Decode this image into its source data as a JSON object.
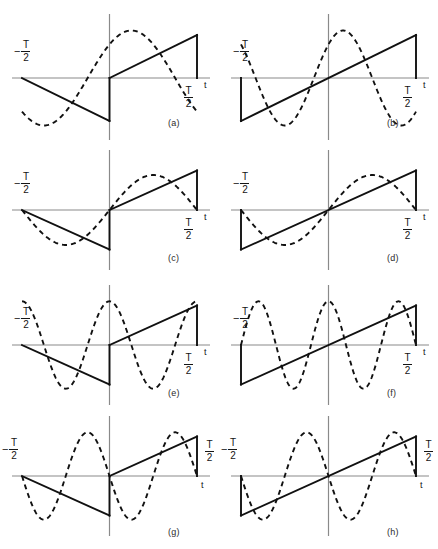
{
  "figure": {
    "title": "",
    "background": "#ffffff",
    "solid_color": "#111111",
    "dashed_color": "#111111",
    "axis_color": "#8a8a8a",
    "columns": 2,
    "rows": 4,
    "panel_width": 219,
    "panel_height": 137,
    "axis_labels": {
      "left_minus": "−",
      "numerator": "T",
      "denominator": "2",
      "time_axis": "t"
    }
  },
  "chart_data": {
    "type": "line",
    "title": "",
    "xlabel": "t",
    "ylabel": "",
    "xlim": [
      -0.5,
      0.5
    ],
    "ylim": [
      -1.15,
      1.15
    ],
    "grid": false,
    "legend": null,
    "shared": {
      "x_ticks": [
        -0.5,
        0,
        0.5
      ],
      "x_tick_labels": [
        "-T/2",
        "0",
        "T/2"
      ],
      "period_T": 1,
      "solid_style": "solid",
      "dashed_style": "dashed",
      "dash_pattern": "5,4"
    },
    "panels": [
      {
        "id": "a",
        "letter": "(a)",
        "solid": {
          "name": "sawtooth-half-shift",
          "type": "sawtooth",
          "description": "descending ramp on [-T/2,0) from 0 to -1, jump to 0, ascending ramp on [0,T/2) from 0 to +1, vertical drop at T/2",
          "segments": [
            {
              "points": [
                [
                  -0.5,
                  0.0
                ],
                [
                  0.0,
                  -0.86
                ]
              ]
            },
            {
              "points": [
                [
                  0.0,
                  -0.86
                ],
                [
                  0.0,
                  0.0
                ]
              ]
            },
            {
              "points": [
                [
                  0.0,
                  0.0
                ],
                [
                  0.5,
                  0.86
                ]
              ]
            },
            {
              "points": [
                [
                  0.5,
                  0.86
                ],
                [
                  0.5,
                  0.0
                ]
              ]
            }
          ]
        },
        "dashed": {
          "name": "harmonic-1-cosine-like",
          "type": "sinusoid",
          "harmonic": 1,
          "amplitude": 0.95,
          "phase_deg": 45,
          "expression": "A*sin(2*pi*t/T + 45deg)"
        },
        "labels": {
          "left": "-T/2",
          "right": "T/2",
          "axis": "t"
        }
      },
      {
        "id": "b",
        "letter": "(b)",
        "solid": {
          "name": "sawtooth-full-ramp",
          "type": "sawtooth",
          "description": "ramp from -1 at -T/2 rising linearly to +1 at T/2, vertical risers at both ends",
          "segments": [
            {
              "points": [
                [
                  -0.5,
                  0.0
                ],
                [
                  -0.5,
                  -0.86
                ]
              ]
            },
            {
              "points": [
                [
                  -0.5,
                  -0.86
                ],
                [
                  0.5,
                  0.86
                ]
              ]
            },
            {
              "points": [
                [
                  0.5,
                  0.86
                ],
                [
                  0.5,
                  0.0
                ]
              ]
            }
          ]
        },
        "dashed": {
          "name": "harmonic-1-shifted",
          "type": "sinusoid",
          "harmonic": 1.5,
          "amplitude": 0.95,
          "phase_deg": 45,
          "expression": "A*sin(3*pi*t/T + 45deg)"
        },
        "labels": {
          "left": "-T/2",
          "right": "T/2",
          "axis": "t"
        }
      },
      {
        "id": "c",
        "letter": "(c)",
        "solid": {
          "name": "sawtooth-half-shift",
          "type": "sawtooth",
          "description": "descending ramp on [-T/2,0) from 0 to -1, jump to 0, ascending ramp on [0,T/2) from 0 to +1, vertical drop at T/2",
          "segments": [
            {
              "points": [
                [
                  -0.5,
                  0.0
                ],
                [
                  0.0,
                  -0.86
                ]
              ]
            },
            {
              "points": [
                [
                  0.0,
                  -0.86
                ],
                [
                  0.0,
                  0.0
                ]
              ]
            },
            {
              "points": [
                [
                  0.0,
                  0.0
                ],
                [
                  0.5,
                  0.86
                ]
              ]
            },
            {
              "points": [
                [
                  0.5,
                  0.86
                ],
                [
                  0.5,
                  0.0
                ]
              ]
            }
          ]
        },
        "dashed": {
          "name": "harmonic-1-sine",
          "type": "sinusoid",
          "harmonic": 1,
          "amplitude": 0.76,
          "phase_deg": 0,
          "expression": "A*sin(2*pi*t/T)"
        },
        "labels": {
          "left": "-T/2",
          "right": "T/2",
          "axis": "t"
        }
      },
      {
        "id": "d",
        "letter": "(d)",
        "solid": {
          "name": "sawtooth-full-ramp",
          "type": "sawtooth",
          "description": "ramp from -1 at -T/2 rising linearly to +1 at T/2, vertical risers at both ends",
          "segments": [
            {
              "points": [
                [
                  -0.5,
                  0.0
                ],
                [
                  -0.5,
                  -0.86
                ]
              ]
            },
            {
              "points": [
                [
                  -0.5,
                  -0.86
                ],
                [
                  0.5,
                  0.86
                ]
              ]
            },
            {
              "points": [
                [
                  0.5,
                  0.86
                ],
                [
                  0.5,
                  0.0
                ]
              ]
            }
          ]
        },
        "dashed": {
          "name": "harmonic-1-sine",
          "type": "sinusoid",
          "harmonic": 1,
          "amplitude": 0.76,
          "phase_deg": 0,
          "expression": "A*sin(2*pi*t/T)"
        },
        "labels": {
          "left": "-T/2",
          "right": "T/2",
          "axis": "t"
        }
      },
      {
        "id": "e",
        "letter": "(e)",
        "solid": {
          "name": "sawtooth-half-shift",
          "type": "sawtooth",
          "description": "descending ramp on [-T/2,0) from 0 to -1, jump to 0, ascending ramp on [0,T/2) from 0 to +1, vertical drop at T/2",
          "segments": [
            {
              "points": [
                [
                  -0.5,
                  0.0
                ],
                [
                  0.0,
                  -0.86
                ]
              ]
            },
            {
              "points": [
                [
                  0.0,
                  -0.86
                ],
                [
                  0.0,
                  0.0
                ]
              ]
            },
            {
              "points": [
                [
                  0.0,
                  0.0
                ],
                [
                  0.5,
                  0.86
                ]
              ]
            },
            {
              "points": [
                [
                  0.5,
                  0.86
                ],
                [
                  0.5,
                  0.0
                ]
              ]
            }
          ]
        },
        "dashed": {
          "name": "harmonic-2-cosine",
          "type": "sinusoid",
          "harmonic": 2,
          "amplitude": 0.95,
          "phase_deg": 90,
          "expression": "A*cos(4*pi*t/T)"
        },
        "labels": {
          "left": "-T/2",
          "right": "T/2",
          "axis": "t"
        }
      },
      {
        "id": "f",
        "letter": "(f)",
        "solid": {
          "name": "sawtooth-full-ramp",
          "type": "sawtooth",
          "description": "ramp from -1 at -T/2 rising linearly to +1 at T/2, vertical risers at both ends",
          "segments": [
            {
              "points": [
                [
                  -0.5,
                  0.0
                ],
                [
                  -0.5,
                  -0.86
                ]
              ]
            },
            {
              "points": [
                [
                  -0.5,
                  -0.86
                ],
                [
                  0.5,
                  0.86
                ]
              ]
            },
            {
              "points": [
                [
                  0.5,
                  0.86
                ],
                [
                  0.5,
                  0.0
                ]
              ]
            }
          ]
        },
        "dashed": {
          "name": "harmonic-2p5-cosine",
          "type": "sinusoid",
          "harmonic": 2.5,
          "amplitude": 0.95,
          "phase_deg": 90,
          "expression": "A*cos(5*pi*t/T)"
        },
        "labels": {
          "left": "-T/2",
          "right": "T/2",
          "axis": "t"
        }
      },
      {
        "id": "g",
        "letter": "(g)",
        "solid": {
          "name": "sawtooth-half-shift",
          "type": "sawtooth",
          "description": "descending ramp on [-T/2,0) from 0 to -1, jump to 0, ascending ramp on [0,T/2) from 0 to +1, vertical drop at T/2",
          "segments": [
            {
              "points": [
                [
                  -0.5,
                  0.0
                ],
                [
                  0.0,
                  -0.86
                ]
              ]
            },
            {
              "points": [
                [
                  0.0,
                  -0.86
                ],
                [
                  0.0,
                  0.0
                ]
              ]
            },
            {
              "points": [
                [
                  0.0,
                  0.0
                ],
                [
                  0.5,
                  0.86
                ]
              ]
            },
            {
              "points": [
                [
                  0.5,
                  0.86
                ],
                [
                  0.5,
                  0.0
                ]
              ]
            }
          ]
        },
        "dashed": {
          "name": "harmonic-2-negative-sine",
          "type": "sinusoid",
          "harmonic": 2,
          "amplitude": 0.95,
          "phase_deg": 180,
          "expression": "-A*sin(4*pi*t/T)"
        },
        "labels": {
          "left": "-T/2",
          "right": "T/2",
          "axis": "t"
        }
      },
      {
        "id": "h",
        "letter": "(h)",
        "solid": {
          "name": "sawtooth-full-ramp",
          "type": "sawtooth",
          "description": "ramp from -1 at -T/2 rising linearly to +1 at T/2, vertical risers at both ends",
          "segments": [
            {
              "points": [
                [
                  -0.5,
                  0.0
                ],
                [
                  -0.5,
                  -0.86
                ]
              ]
            },
            {
              "points": [
                [
                  -0.5,
                  -0.86
                ],
                [
                  0.5,
                  0.86
                ]
              ]
            },
            {
              "points": [
                [
                  0.5,
                  0.86
                ],
                [
                  0.5,
                  0.0
                ]
              ]
            }
          ]
        },
        "dashed": {
          "name": "harmonic-2-negative-sine",
          "type": "sinusoid",
          "harmonic": 2,
          "amplitude": 0.95,
          "phase_deg": 180,
          "expression": "-A*sin(4*pi*t/T)"
        },
        "labels": {
          "left": "-T/2",
          "right": "T/2",
          "axis": "t"
        }
      }
    ]
  }
}
